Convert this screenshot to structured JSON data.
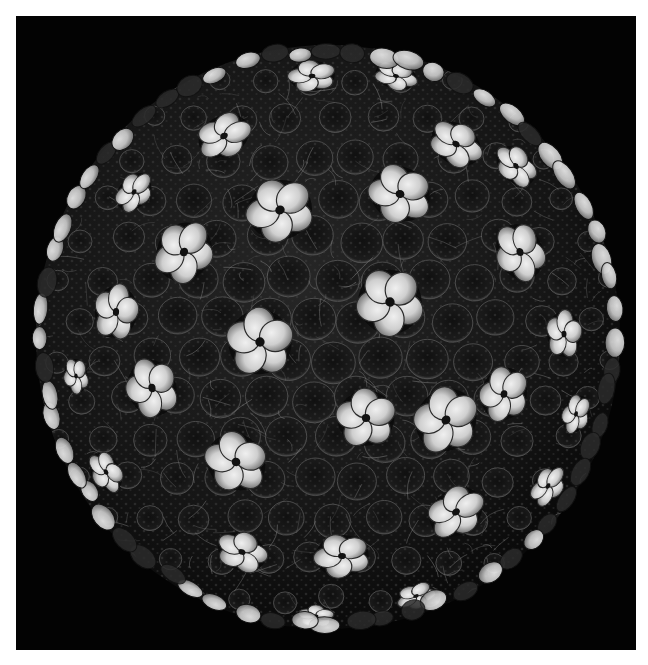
{
  "image": {
    "description": "Rendered surface model of an icosahedral virus capsid composed of pentameric capsomeres, displayed on a black background",
    "background_color": "#030303",
    "page_color": "#ffffff",
    "frame": {
      "left": 16,
      "top": 16,
      "width": 620,
      "height": 634
    },
    "sphere": {
      "cx": 312,
      "cy": 321,
      "r": 292
    },
    "colors": {
      "lobe_light": "#e6e6e6",
      "lobe_mid": "#a9a9a9",
      "capsomere_dark": "#1a1a1a",
      "mesh_lines": "#8a8a8a",
      "speckle": "#3a3a3a"
    },
    "pentamers": [
      {
        "x": 264,
        "y": 194,
        "r": 34
      },
      {
        "x": 384,
        "y": 178,
        "r": 32
      },
      {
        "x": 440,
        "y": 128,
        "r": 28
      },
      {
        "x": 208,
        "y": 120,
        "r": 28
      },
      {
        "x": 296,
        "y": 60,
        "r": 24
      },
      {
        "x": 504,
        "y": 236,
        "r": 30
      },
      {
        "x": 168,
        "y": 236,
        "r": 32
      },
      {
        "x": 374,
        "y": 286,
        "r": 34
      },
      {
        "x": 244,
        "y": 326,
        "r": 34
      },
      {
        "x": 100,
        "y": 296,
        "r": 28
      },
      {
        "x": 548,
        "y": 318,
        "r": 24
      },
      {
        "x": 430,
        "y": 404,
        "r": 34
      },
      {
        "x": 220,
        "y": 446,
        "r": 32
      },
      {
        "x": 136,
        "y": 372,
        "r": 30
      },
      {
        "x": 488,
        "y": 378,
        "r": 28
      },
      {
        "x": 350,
        "y": 402,
        "r": 30
      },
      {
        "x": 440,
        "y": 496,
        "r": 30
      },
      {
        "x": 326,
        "y": 540,
        "r": 28
      },
      {
        "x": 226,
        "y": 536,
        "r": 26
      },
      {
        "x": 532,
        "y": 470,
        "r": 22
      },
      {
        "x": 90,
        "y": 456,
        "r": 22
      },
      {
        "x": 118,
        "y": 176,
        "r": 22
      },
      {
        "x": 500,
        "y": 150,
        "r": 24
      },
      {
        "x": 560,
        "y": 398,
        "r": 20
      },
      {
        "x": 300,
        "y": 600,
        "r": 18
      },
      {
        "x": 400,
        "y": 580,
        "r": 20
      },
      {
        "x": 60,
        "y": 360,
        "r": 18
      },
      {
        "x": 380,
        "y": 60,
        "r": 22
      }
    ]
  }
}
